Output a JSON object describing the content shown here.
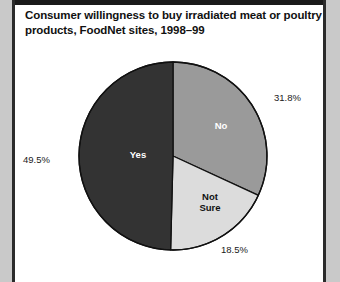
{
  "figure": {
    "title_line1": "Consumer willingness to buy irradiated meat or poultry",
    "title_line2": "products, FoodNet sites, 1998–99"
  },
  "chart_data": {
    "type": "pie",
    "title": "Consumer willingness to buy irradiated meat or poultry products, FoodNet sites, 1998–99",
    "xlabel": "",
    "ylabel": "",
    "legend_position": "none",
    "grid": false,
    "start_angle_deg": 0,
    "direction": "clockwise",
    "categories": [
      "No",
      "Not Sure",
      "Yes"
    ],
    "values": [
      31.8,
      18.5,
      49.5
    ],
    "unit": "%",
    "slices": [
      {
        "label": "No",
        "value": 31.8,
        "value_label": "31.8%",
        "color": "#9a9a9a",
        "label_color": "#ffffff",
        "label_placement": "inside",
        "callout_placement": "upper-right"
      },
      {
        "label": "Not\nSure",
        "value": 18.5,
        "value_label": "18.5%",
        "color": "#dcdcdc",
        "label_color": "#111111",
        "label_placement": "inside",
        "callout_placement": "lower-right"
      },
      {
        "label": "Yes",
        "value": 49.5,
        "value_label": "49.5%",
        "color": "#333333",
        "label_color": "#ffffff",
        "label_placement": "inside",
        "callout_placement": "left"
      }
    ],
    "annotations": []
  },
  "colors": {
    "page_background": "#c9c9c9",
    "plate_background": "#ffffff",
    "frame_rule": "#2b2b2b",
    "slice_no": "#9a9a9a",
    "slice_not_sure": "#dcdcdc",
    "slice_yes": "#333333",
    "outline": "#111111",
    "text": "#111111"
  }
}
